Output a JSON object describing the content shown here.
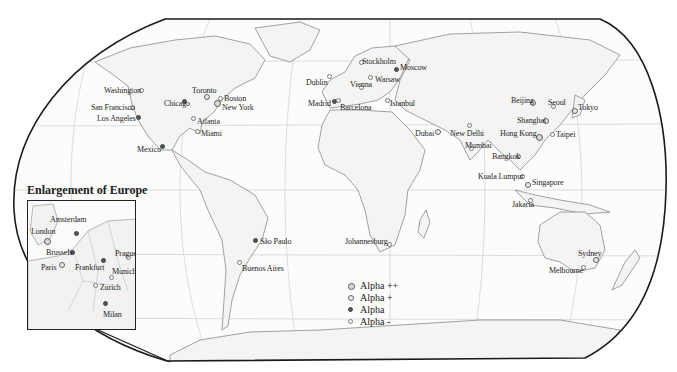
{
  "map": {
    "inset_title": "Enlargement of Europe",
    "legend": [
      {
        "label": "Alpha ++",
        "class": "a2"
      },
      {
        "label": "Alpha +",
        "class": "a1"
      },
      {
        "label": "Alpha",
        "class": "a0"
      },
      {
        "label": "Alpha -",
        "class": "am"
      }
    ],
    "cities": [
      {
        "name": "Washington",
        "class": "am",
        "x": 142,
        "y": 91,
        "lx": 104,
        "ly": 86
      },
      {
        "name": "San Francisco",
        "class": "am",
        "x": 133,
        "y": 108,
        "lx": 91,
        "ly": 103
      },
      {
        "name": "Los Angeles",
        "class": "a0",
        "x": 139,
        "y": 118,
        "lx": 97,
        "ly": 114
      },
      {
        "name": "Chicago",
        "class": "a0",
        "x": 185,
        "y": 102,
        "lx": 164,
        "ly": 99
      },
      {
        "name": "Toronto",
        "class": "a1",
        "x": 207,
        "y": 97,
        "lx": 192,
        "ly": 86
      },
      {
        "name": "Boston",
        "class": "am",
        "x": 221,
        "y": 99,
        "lx": 224,
        "ly": 94
      },
      {
        "name": "New York",
        "class": "a2",
        "x": 217,
        "y": 103,
        "lx": 222,
        "ly": 103
      },
      {
        "name": "Atlanta",
        "class": "am",
        "x": 194,
        "y": 119,
        "lx": 197,
        "ly": 117
      },
      {
        "name": "Miami",
        "class": "am",
        "x": 198,
        "y": 132,
        "lx": 201,
        "ly": 129
      },
      {
        "name": "Mexico",
        "class": "a0",
        "x": 163,
        "y": 147,
        "lx": 137,
        "ly": 145
      },
      {
        "name": "Dublin",
        "class": "am",
        "x": 330,
        "y": 77,
        "lx": 306,
        "ly": 78
      },
      {
        "name": "Madrid",
        "class": "a0",
        "x": 335,
        "y": 102,
        "lx": 308,
        "ly": 99
      },
      {
        "name": "Barcelona",
        "class": "am",
        "x": 339,
        "y": 101,
        "lx": 340,
        "ly": 103
      },
      {
        "name": "Stockholm",
        "class": "am",
        "x": 362,
        "y": 63,
        "lx": 362,
        "ly": 57
      },
      {
        "name": "Moscow",
        "class": "a0",
        "x": 397,
        "y": 70,
        "lx": 400,
        "ly": 63
      },
      {
        "name": "Warsaw",
        "class": "am",
        "x": 371,
        "y": 78,
        "lx": 375,
        "ly": 75
      },
      {
        "name": "Vienna",
        "class": "am",
        "x": 362,
        "y": 88,
        "lx": 350,
        "ly": 80
      },
      {
        "name": "Istanbul",
        "class": "am",
        "x": 388,
        "y": 101,
        "lx": 390,
        "ly": 99
      },
      {
        "name": "Dubai",
        "class": "a1",
        "x": 438,
        "y": 132,
        "lx": 415,
        "ly": 129
      },
      {
        "name": "New Delhi",
        "class": "am",
        "x": 470,
        "y": 126,
        "lx": 450,
        "ly": 129
      },
      {
        "name": "Mumbai",
        "class": "am",
        "x": 472,
        "y": 149,
        "lx": 465,
        "ly": 141
      },
      {
        "name": "Beijing",
        "class": "a1",
        "x": 533,
        "y": 103,
        "lx": 511,
        "ly": 96
      },
      {
        "name": "Seoul",
        "class": "am",
        "x": 554,
        "y": 107,
        "lx": 548,
        "ly": 98
      },
      {
        "name": "Tokyo",
        "class": "a1",
        "x": 575,
        "y": 111,
        "lx": 578,
        "ly": 103
      },
      {
        "name": "Shanghai",
        "class": "a1",
        "x": 546,
        "y": 121,
        "lx": 517,
        "ly": 116
      },
      {
        "name": "Hong Kong",
        "class": "a2",
        "x": 539,
        "y": 137,
        "lx": 500,
        "ly": 129
      },
      {
        "name": "Taipei",
        "class": "am",
        "x": 553,
        "y": 135,
        "lx": 556,
        "ly": 130
      },
      {
        "name": "Bangkok",
        "class": "am",
        "x": 519,
        "y": 157,
        "lx": 492,
        "ly": 152
      },
      {
        "name": "Kuala Lumpur",
        "class": "am",
        "x": 523,
        "y": 177,
        "lx": 478,
        "ly": 172
      },
      {
        "name": "Singapore",
        "class": "a1",
        "x": 528,
        "y": 185,
        "lx": 532,
        "ly": 178
      },
      {
        "name": "Jakarta",
        "class": "am",
        "x": 531,
        "y": 201,
        "lx": 512,
        "ly": 200
      },
      {
        "name": "São Paulo",
        "class": "a0",
        "x": 256,
        "y": 241,
        "lx": 260,
        "ly": 237
      },
      {
        "name": "Buenos Aires",
        "class": "am",
        "x": 240,
        "y": 263,
        "lx": 242,
        "ly": 264
      },
      {
        "name": "Johannesburg",
        "class": "am",
        "x": 390,
        "y": 245,
        "lx": 345,
        "ly": 237
      },
      {
        "name": "Sydney",
        "class": "a1",
        "x": 596,
        "y": 260,
        "lx": 578,
        "ly": 249
      },
      {
        "name": "Melbourne",
        "class": "am",
        "x": 584,
        "y": 268,
        "lx": 549,
        "ly": 266
      }
    ],
    "europe_cities": [
      {
        "name": "London",
        "class": "a2",
        "x": 19,
        "y": 40,
        "lx": 3,
        "ly": 26
      },
      {
        "name": "Amsterdam",
        "class": "a0",
        "x": 49,
        "y": 33,
        "lx": 22,
        "ly": 14
      },
      {
        "name": "Brussels",
        "class": "a0",
        "x": 45,
        "y": 52,
        "lx": 18,
        "ly": 47
      },
      {
        "name": "Paris",
        "class": "a1",
        "x": 34,
        "y": 64,
        "lx": 13,
        "ly": 62
      },
      {
        "name": "Frankfurt",
        "class": "a0",
        "x": 76,
        "y": 60,
        "lx": 47,
        "ly": 62
      },
      {
        "name": "Prague",
        "class": "am",
        "x": 101,
        "y": 57,
        "lx": 87,
        "ly": 48
      },
      {
        "name": "Munich",
        "class": "am",
        "x": 84,
        "y": 77,
        "lx": 84,
        "ly": 66
      },
      {
        "name": "Zurich",
        "class": "am",
        "x": 68,
        "y": 85,
        "lx": 72,
        "ly": 82
      },
      {
        "name": "Milan",
        "class": "a0",
        "x": 78,
        "y": 103,
        "lx": 75,
        "ly": 109
      }
    ]
  }
}
